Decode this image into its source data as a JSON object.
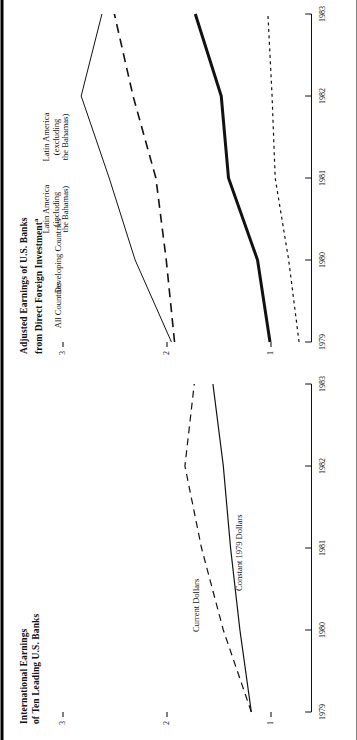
{
  "figure": {
    "orientation": "rotated-90-ccw",
    "background": "#ffffff",
    "ink_color": "#111111"
  },
  "panels": [
    {
      "id": "left",
      "title": "International Earnings\nof Ten Leading U.S. Banks",
      "footnote_marker": "",
      "series_labels": [
        {
          "name": "current-dollars",
          "text": "Current Dollars"
        },
        {
          "name": "constant-dollars",
          "text": "Constant 1979 Dollars"
        }
      ]
    },
    {
      "id": "right",
      "title": "Adjusted Earnings of U.S. Banks\nfrom Direct Foreign Investment",
      "footnote_marker": "a",
      "series_labels": [
        {
          "name": "all-countries",
          "text": "All Countries"
        },
        {
          "name": "developing-countries",
          "text": "Developing Countries"
        },
        {
          "name": "latin-america-including",
          "text": "Latin America\n(including\nthe Bahamas)"
        },
        {
          "name": "latin-america-excluding",
          "text": "Latin America\n(excluding\nthe Bahamas)"
        }
      ]
    }
  ],
  "chart_data": [
    {
      "id": "international-earnings",
      "type": "line",
      "title": "International Earnings of Ten Leading U.S. Banks",
      "xlabel": "",
      "ylabel": "",
      "x": [
        "1979",
        "1980",
        "1981",
        "1982",
        "1983"
      ],
      "xtick_labels": [
        "1979",
        "1980",
        "1981",
        "1982",
        "1983"
      ],
      "ytick_labels": [
        "1",
        "2",
        "3"
      ],
      "ylim": [
        0.6,
        3.0
      ],
      "grid": false,
      "legend": "inline-annotations",
      "series": [
        {
          "name": "Current Dollars",
          "style": "dashed",
          "linewidth": 1.2,
          "values": [
            1.18,
            1.45,
            1.66,
            1.82,
            1.73
          ]
        },
        {
          "name": "Constant 1979 Dollars",
          "style": "solid",
          "linewidth": 1.2,
          "values": [
            1.18,
            1.29,
            1.38,
            1.45,
            1.55
          ]
        }
      ]
    },
    {
      "id": "adjusted-earnings-direct-foreign-investment",
      "type": "line",
      "title": "Adjusted Earnings of U.S. Banks from Direct Foreign Investment",
      "xlabel": "",
      "ylabel": "",
      "x": [
        "1979",
        "1980",
        "1981",
        "1982",
        "1983"
      ],
      "xtick_labels": [
        "1979",
        "1980",
        "1981",
        "1982",
        "1983"
      ],
      "ytick_labels": [
        "1",
        "2",
        "3"
      ],
      "ylim": [
        0.6,
        3.0
      ],
      "grid": false,
      "legend": "inline-annotations",
      "series": [
        {
          "name": "All Countries",
          "style": "solid",
          "linewidth": 1.0,
          "values": [
            1.95,
            2.3,
            2.55,
            2.82,
            2.62
          ]
        },
        {
          "name": "Developing Countries",
          "style": "dashed",
          "linewidth": 1.6,
          "values": [
            1.92,
            2.0,
            2.1,
            2.32,
            2.5
          ]
        },
        {
          "name": "Latin America (including the Bahamas)",
          "style": "solid",
          "linewidth": 3.0,
          "values": [
            1.0,
            1.12,
            1.4,
            1.47,
            1.72
          ]
        },
        {
          "name": "Latin America (excluding the Bahamas)",
          "style": "dotted",
          "linewidth": 1.2,
          "values": [
            0.72,
            0.82,
            0.95,
            0.98,
            1.02
          ]
        }
      ]
    }
  ]
}
